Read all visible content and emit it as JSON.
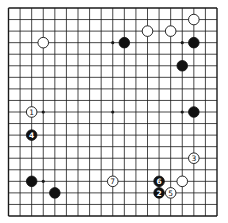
{
  "board": {
    "size": 19,
    "colors": {
      "black": "#111111",
      "white": "#ffffff",
      "line": "#1a1a1a"
    },
    "star_points": [
      [
        3,
        3
      ],
      [
        9,
        3
      ],
      [
        15,
        3
      ],
      [
        3,
        9
      ],
      [
        9,
        9
      ],
      [
        15,
        9
      ],
      [
        3,
        15
      ],
      [
        9,
        15
      ],
      [
        15,
        15
      ]
    ],
    "stones": [
      {
        "color": "white",
        "col": 3,
        "row": 3,
        "label": ""
      },
      {
        "color": "white",
        "col": 16,
        "row": 1,
        "label": ""
      },
      {
        "color": "white",
        "col": 12,
        "row": 2,
        "label": ""
      },
      {
        "color": "white",
        "col": 14,
        "row": 2,
        "label": ""
      },
      {
        "color": "black",
        "col": 10,
        "row": 3,
        "label": ""
      },
      {
        "color": "black",
        "col": 16,
        "row": 3,
        "label": ""
      },
      {
        "color": "black",
        "col": 15,
        "row": 5,
        "label": ""
      },
      {
        "color": "black",
        "col": 16,
        "row": 9,
        "label": ""
      },
      {
        "color": "white",
        "col": 2,
        "row": 9,
        "label": "1"
      },
      {
        "color": "black",
        "col": 13,
        "row": 16,
        "label": "2"
      },
      {
        "color": "white",
        "col": 16,
        "row": 13,
        "label": "3"
      },
      {
        "color": "black",
        "col": 2,
        "row": 11,
        "label": "4"
      },
      {
        "color": "white",
        "col": 14,
        "row": 16,
        "label": "5"
      },
      {
        "color": "black",
        "col": 13,
        "row": 15,
        "label": "6"
      },
      {
        "color": "white",
        "col": 9,
        "row": 15,
        "label": "7"
      },
      {
        "color": "black",
        "col": 2,
        "row": 15,
        "label": ""
      },
      {
        "color": "black",
        "col": 4,
        "row": 16,
        "label": ""
      },
      {
        "color": "white",
        "col": 15,
        "row": 15,
        "label": ""
      }
    ]
  }
}
